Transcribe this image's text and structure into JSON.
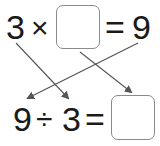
{
  "top_equation": {
    "operand_left": "3",
    "operator": "×",
    "blank": "",
    "equals": "=",
    "result": "9"
  },
  "bottom_equation": {
    "operand_left": "9",
    "operator": "÷",
    "operand_right": "3",
    "equals": "=",
    "blank": ""
  },
  "arrows": [
    {
      "from": "top-3",
      "to": "bottom-3"
    },
    {
      "from": "top-9",
      "to": "bottom-9"
    },
    {
      "from": "top-box",
      "to": "bottom-box"
    }
  ],
  "colors": {
    "text": "#1a1a1a",
    "box_border": "#8a8a8a",
    "arrow": "#555555"
  }
}
